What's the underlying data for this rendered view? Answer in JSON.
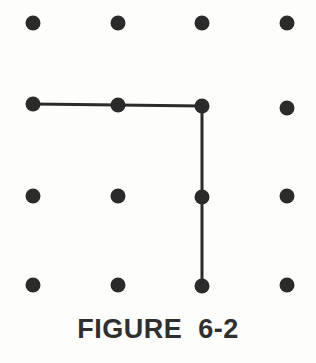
{
  "figure": {
    "caption": "FIGURE  6-2",
    "width": 316,
    "height": 363,
    "background_color": "#fdfdfc",
    "ink_color": "#2b2b2b",
    "caption_color": "#2f2f2f"
  },
  "chart_data": {
    "type": "scatter",
    "title": "FIGURE  6-2",
    "subtitle": "",
    "xlabel": "",
    "ylabel": "",
    "grid": {
      "rows": 4,
      "columns": 4,
      "column_x": [
        33,
        118,
        202,
        287
      ],
      "row_y": [
        23,
        105,
        196,
        285
      ],
      "dot_diameter": 15,
      "dot_color": "#2b2b2b"
    },
    "x": [
      33,
      118,
      202,
      287,
      33,
      118,
      202,
      287,
      33,
      118,
      202,
      287,
      33,
      118,
      202,
      287
    ],
    "y": [
      23,
      23,
      23,
      23,
      105,
      105,
      105,
      105,
      196,
      196,
      196,
      196,
      285,
      285,
      285,
      285
    ],
    "points": [
      {
        "id": "r1c1",
        "row": 1,
        "col": 1,
        "x": 33,
        "y": 23,
        "on_path": false
      },
      {
        "id": "r1c2",
        "row": 1,
        "col": 2,
        "x": 118,
        "y": 23,
        "on_path": false
      },
      {
        "id": "r1c3",
        "row": 1,
        "col": 3,
        "x": 202,
        "y": 23,
        "on_path": false
      },
      {
        "id": "r1c4",
        "row": 1,
        "col": 4,
        "x": 287,
        "y": 23,
        "on_path": false
      },
      {
        "id": "r2c1",
        "row": 2,
        "col": 1,
        "x": 33,
        "y": 104,
        "on_path": true
      },
      {
        "id": "r2c2",
        "row": 2,
        "col": 2,
        "x": 118,
        "y": 105,
        "on_path": true
      },
      {
        "id": "r2c3",
        "row": 2,
        "col": 3,
        "x": 202,
        "y": 106,
        "on_path": true
      },
      {
        "id": "r2c4",
        "row": 2,
        "col": 4,
        "x": 287,
        "y": 108,
        "on_path": false
      },
      {
        "id": "r3c1",
        "row": 3,
        "col": 1,
        "x": 33,
        "y": 196,
        "on_path": false
      },
      {
        "id": "r3c2",
        "row": 3,
        "col": 2,
        "x": 118,
        "y": 196,
        "on_path": false
      },
      {
        "id": "r3c3",
        "row": 3,
        "col": 3,
        "x": 202,
        "y": 197,
        "on_path": true
      },
      {
        "id": "r3c4",
        "row": 3,
        "col": 4,
        "x": 287,
        "y": 196,
        "on_path": false
      },
      {
        "id": "r4c1",
        "row": 4,
        "col": 1,
        "x": 33,
        "y": 285,
        "on_path": false
      },
      {
        "id": "r4c2",
        "row": 4,
        "col": 2,
        "x": 118,
        "y": 285,
        "on_path": false
      },
      {
        "id": "r4c3",
        "row": 4,
        "col": 3,
        "x": 202,
        "y": 286,
        "on_path": true
      },
      {
        "id": "r4c4",
        "row": 4,
        "col": 4,
        "x": 287,
        "y": 285,
        "on_path": false
      }
    ],
    "path": {
      "name": "connected-polyline",
      "stroke_color": "#2b2b2b",
      "stroke_width": 3,
      "vertices": [
        "r2c1",
        "r2c2",
        "r2c3",
        "r3c3",
        "r4c3"
      ],
      "svg_points": "33,104 118,105 202,106 202,197 202,286",
      "segments": [
        {
          "from": "r2c1",
          "to": "r2c3",
          "orientation": "horizontal"
        },
        {
          "from": "r2c3",
          "to": "r4c3",
          "orientation": "vertical"
        }
      ]
    },
    "legend": {
      "entries": [],
      "position": "none"
    },
    "axes": {
      "visible": false,
      "xlim": [
        0,
        316
      ],
      "ylim": [
        0,
        363
      ]
    }
  }
}
